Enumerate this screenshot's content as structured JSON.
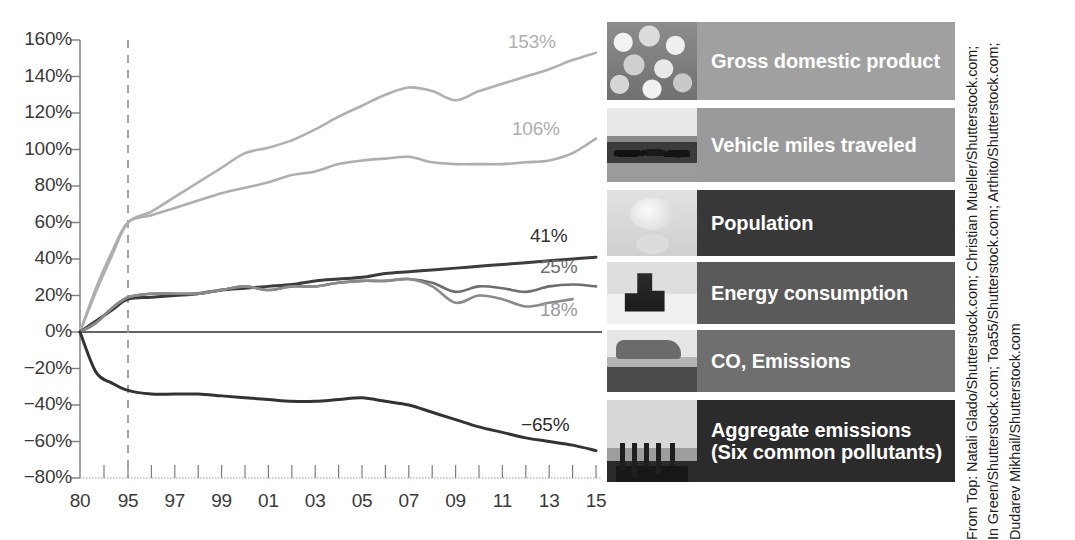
{
  "chart_data": {
    "type": "line",
    "title": "",
    "xlabel": "",
    "ylabel": "",
    "ylim": [
      -80,
      160
    ],
    "ytick_labels": [
      "160%",
      "140%",
      "120%",
      "100%",
      "80%",
      "60%",
      "40%",
      "20%",
      "0%",
      "−20%",
      "−40%",
      "−60%",
      "−80%"
    ],
    "ytick_values": [
      160,
      140,
      120,
      100,
      80,
      60,
      40,
      20,
      0,
      -20,
      -40,
      -60,
      -80
    ],
    "xtick_labels": [
      "80",
      "95",
      "97",
      "99",
      "01",
      "03",
      "05",
      "07",
      "09",
      "11",
      "13",
      "15"
    ],
    "xtick_values": [
      1980,
      1995,
      1997,
      1999,
      2001,
      2003,
      2005,
      2007,
      2009,
      2011,
      2013,
      2015
    ],
    "grid": false,
    "legend_position": "right-panel",
    "annotations": [
      {
        "text": "Reference year marker at 1995",
        "type": "dashed-vertical-line",
        "x": 1995
      },
      {
        "text": "Zero baseline",
        "type": "horizontal-line",
        "y": 0
      }
    ],
    "series": [
      {
        "name": "Gross domestic product",
        "end_label": "153%",
        "color": "#b0b0b0",
        "x": [
          1980,
          1985,
          1990,
          1995,
          1996,
          1997,
          1998,
          1999,
          2000,
          2001,
          2002,
          2003,
          2004,
          2005,
          2006,
          2007,
          2008,
          2009,
          2010,
          2011,
          2012,
          2013,
          2014,
          2015
        ],
        "values": [
          0,
          22,
          42,
          60,
          66,
          74,
          82,
          90,
          98,
          101,
          105,
          111,
          118,
          124,
          130,
          134,
          132,
          127,
          132,
          136,
          140,
          144,
          149,
          153
        ]
      },
      {
        "name": "Vehicle miles traveled",
        "end_label": "106%",
        "color": "#aeaeae",
        "x": [
          1980,
          1985,
          1990,
          1995,
          1996,
          1997,
          1998,
          1999,
          2000,
          2001,
          2002,
          2003,
          2004,
          2005,
          2006,
          2007,
          2008,
          2009,
          2010,
          2011,
          2012,
          2013,
          2014,
          2015
        ],
        "values": [
          0,
          24,
          44,
          60,
          64,
          68,
          72,
          76,
          79,
          82,
          86,
          88,
          92,
          94,
          95,
          96,
          93,
          92,
          92,
          92,
          93,
          94,
          98,
          106
        ]
      },
      {
        "name": "Population",
        "end_label": "41%",
        "color": "#3c3c3c",
        "x": [
          1980,
          1985,
          1990,
          1995,
          1996,
          1997,
          1998,
          1999,
          2000,
          2001,
          2002,
          2003,
          2004,
          2005,
          2006,
          2007,
          2008,
          2009,
          2010,
          2011,
          2012,
          2013,
          2014,
          2015
        ],
        "values": [
          0,
          6,
          12,
          18,
          19,
          20,
          21,
          23,
          24,
          25,
          26,
          28,
          29,
          30,
          32,
          33,
          34,
          35,
          36,
          37,
          38,
          39,
          40,
          41
        ]
      },
      {
        "name": "Energy consumption",
        "end_label": "25%",
        "color": "#6e6e6e",
        "x": [
          1980,
          1985,
          1990,
          1995,
          1996,
          1997,
          1998,
          1999,
          2000,
          2001,
          2002,
          2003,
          2004,
          2005,
          2006,
          2007,
          2008,
          2009,
          2010,
          2011,
          2012,
          2013,
          2014,
          2015
        ],
        "values": [
          0,
          5,
          13,
          19,
          21,
          21,
          21,
          23,
          25,
          23,
          25,
          25,
          27,
          28,
          28,
          29,
          27,
          22,
          25,
          24,
          22,
          25,
          26,
          25
        ]
      },
      {
        "name": "CO, Emissions",
        "end_label": "18%",
        "color": "#8a8a8a",
        "x": [
          1980,
          1985,
          1990,
          1995,
          1996,
          1997,
          1998,
          1999,
          2000,
          2001,
          2002,
          2003,
          2004,
          2005,
          2006,
          2007,
          2008,
          2009,
          2010,
          2011,
          2012,
          2013,
          2014
        ],
        "values": [
          0,
          5,
          13,
          19,
          21,
          21,
          21,
          23,
          25,
          23,
          25,
          25,
          27,
          28,
          28,
          29,
          25,
          16,
          20,
          18,
          14,
          16,
          18
        ]
      },
      {
        "name": "Aggregate emissions (Six common pollutants)",
        "end_label": "−65%",
        "color": "#333333",
        "x": [
          1980,
          1985,
          1990,
          1995,
          1996,
          1997,
          1998,
          1999,
          2000,
          2001,
          2002,
          2003,
          2004,
          2005,
          2006,
          2007,
          2008,
          2009,
          2010,
          2011,
          2012,
          2013,
          2014,
          2015
        ],
        "values": [
          0,
          -22,
          -28,
          -32,
          -34,
          -34,
          -34,
          -35,
          -36,
          -37,
          -38,
          -38,
          -37,
          -36,
          -38,
          -40,
          -44,
          -48,
          -52,
          -55,
          -58,
          -60,
          -62,
          -65
        ]
      }
    ]
  },
  "legend": {
    "items": [
      {
        "label": "Gross domestic product",
        "sub": "",
        "bg": "#a0a0a0",
        "thumb": "thumb-coins",
        "thumb_name": "coins-photo"
      },
      {
        "label": "Vehicle miles traveled",
        "sub": "",
        "bg": "#9a9a9a",
        "thumb": "thumb-traffic",
        "thumb_name": "traffic-photo"
      },
      {
        "label": "Population",
        "sub": "",
        "bg": "#383838",
        "thumb": "thumb-baby",
        "thumb_name": "baby-photo"
      },
      {
        "label": "Energy consumption",
        "sub": "",
        "bg": "#5a5a5a",
        "thumb": "thumb-energy",
        "thumb_name": "fuel-pump-photo"
      },
      {
        "label": "CO, Emissions",
        "sub": "",
        "bg": "#6f6f6f",
        "thumb": "thumb-car",
        "thumb_name": "car-exhaust-photo"
      },
      {
        "label": "Aggregate emissions",
        "sub": "(Six common pollutants)",
        "bg": "#2b2b2b",
        "thumb": "thumb-smoke",
        "thumb_name": "smokestacks-photo"
      }
    ]
  },
  "credit": {
    "text": "From Top: Natali Glado/Shutterstock.com; Christian Mueller/Shutterstock.com;\nIn Green/Shutterstock.com; Toa55/Shutterstock.com; Arthito/Shutterstock.com;\nDudarev Mikhail/Shutterstock.com"
  }
}
